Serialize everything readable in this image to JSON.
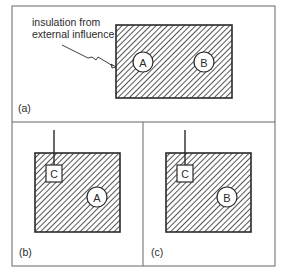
{
  "figure": {
    "panels": [
      {
        "id": "a",
        "label": "(a)",
        "annotation": {
          "line1": "insulation from",
          "line2": "external influence"
        },
        "circles": [
          {
            "label": "A"
          },
          {
            "label": "B"
          }
        ]
      },
      {
        "id": "b",
        "label": "(b)",
        "probe": {
          "label": "C"
        },
        "circles": [
          {
            "label": "A"
          }
        ]
      },
      {
        "id": "c",
        "label": "(c)",
        "probe": {
          "label": "C"
        },
        "circles": [
          {
            "label": "B"
          }
        ]
      }
    ],
    "colors": {
      "ink": "#2a2a2a",
      "frame": "#555555",
      "background": "#ffffff"
    }
  }
}
